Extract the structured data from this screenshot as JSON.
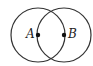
{
  "diagram": {
    "circles": [
      {
        "name": "circle-a",
        "cx": 38,
        "cy": 35,
        "r": 27
      },
      {
        "name": "circle-b",
        "cx": 64,
        "cy": 35,
        "r": 27
      }
    ],
    "points": [
      {
        "label": "A",
        "x": 38,
        "y": 35
      },
      {
        "label": "B",
        "x": 64,
        "y": 35
      }
    ],
    "stroke_color": "#333333"
  }
}
